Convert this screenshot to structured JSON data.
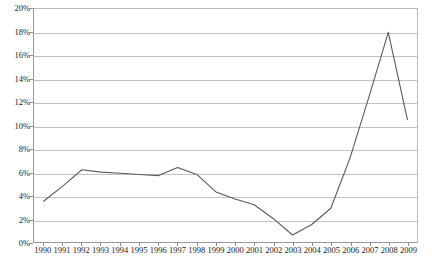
{
  "chart_data": {
    "type": "line",
    "title": "",
    "subtitle": "",
    "xlabel": "",
    "ylabel": "",
    "categories": [
      "1990",
      "1991",
      "1992",
      "1993",
      "1994",
      "1995",
      "1996",
      "1997",
      "1998",
      "1999",
      "2000",
      "2001",
      "2002",
      "2003",
      "2004",
      "2005",
      "2006",
      "2007",
      "2008",
      "2009"
    ],
    "values": [
      3.5,
      4.8,
      6.2,
      6.0,
      5.9,
      5.8,
      5.7,
      6.4,
      5.8,
      4.3,
      3.7,
      3.2,
      2.0,
      0.6,
      1.5,
      2.9,
      7.2,
      12.5,
      18.0,
      10.5
    ],
    "series": [
      {
        "name": "",
        "values": [
          3.5,
          4.8,
          6.2,
          6.0,
          5.9,
          5.8,
          5.7,
          6.4,
          5.8,
          4.3,
          3.7,
          3.2,
          2.0,
          0.6,
          1.5,
          2.9,
          7.2,
          12.5,
          18.0,
          10.5
        ]
      }
    ],
    "ylim": [
      0,
      20
    ],
    "y_ticks": [
      0,
      2,
      4,
      6,
      8,
      10,
      12,
      14,
      16,
      18,
      20
    ],
    "y_tick_labels": [
      "0%",
      "2%",
      "4%",
      "6%",
      "8%",
      "10%",
      "12%",
      "14%",
      "16%",
      "18%",
      "20%"
    ],
    "value_suffix": "%",
    "grid": true,
    "grid_axis": "y",
    "legend": false,
    "legend_position": "none",
    "annotations": [],
    "line_color": "#595959",
    "grid_color": "#c3c3c3",
    "axis_color": "#8d8d8d",
    "background_color": "#ffffff",
    "text_color": "#1a1a1a"
  }
}
